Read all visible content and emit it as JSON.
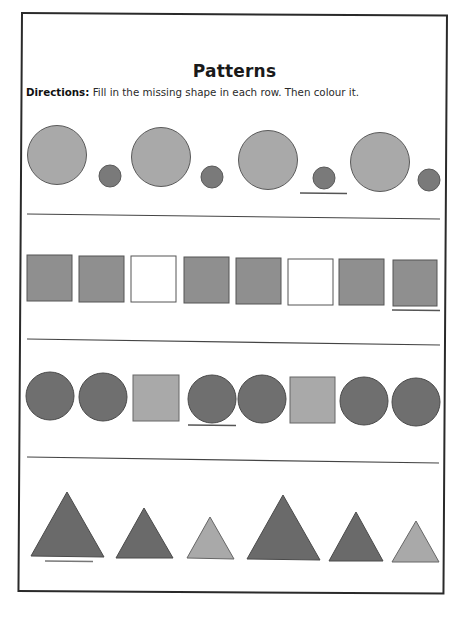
{
  "worksheet": {
    "title": "Patterns",
    "directions_label": "Directions:",
    "directions_text": " Fill in the missing shape in each row. Then colour it."
  },
  "colors": {
    "light_gray": "#a9a9a9",
    "mid_gray": "#8f8f8f",
    "dark_gray": "#6f6f6f",
    "outline": "#555555",
    "blank": "#ffffff",
    "rule": "#444444",
    "border": "#2a2a2a"
  },
  "rows": [
    {
      "name": "circles-size-pattern",
      "shapes": [
        {
          "type": "circle",
          "size": "large",
          "fill": "light_gray"
        },
        {
          "type": "circle",
          "size": "small",
          "fill": "dark_gray"
        },
        {
          "type": "circle",
          "size": "large",
          "fill": "light_gray"
        },
        {
          "type": "circle",
          "size": "small",
          "fill": "dark_gray"
        },
        {
          "type": "circle",
          "size": "large",
          "fill": "light_gray"
        },
        {
          "type": "circle",
          "size": "small",
          "fill": "dark_gray",
          "answer_blank": true
        },
        {
          "type": "circle",
          "size": "large",
          "fill": "light_gray"
        },
        {
          "type": "circle",
          "size": "small",
          "fill": "dark_gray"
        }
      ]
    },
    {
      "name": "squares-color-pattern",
      "shapes": [
        {
          "type": "square",
          "fill": "mid_gray"
        },
        {
          "type": "square",
          "fill": "mid_gray"
        },
        {
          "type": "square",
          "fill": "blank"
        },
        {
          "type": "square",
          "fill": "mid_gray"
        },
        {
          "type": "square",
          "fill": "mid_gray"
        },
        {
          "type": "square",
          "fill": "blank"
        },
        {
          "type": "square",
          "fill": "mid_gray"
        },
        {
          "type": "square",
          "fill": "mid_gray",
          "answer_blank": true
        }
      ]
    },
    {
      "name": "circle-square-pattern",
      "shapes": [
        {
          "type": "circle",
          "fill": "dark_gray"
        },
        {
          "type": "circle",
          "fill": "dark_gray"
        },
        {
          "type": "square",
          "fill": "light_gray"
        },
        {
          "type": "circle",
          "fill": "dark_gray",
          "answer_blank": true
        },
        {
          "type": "circle",
          "fill": "dark_gray"
        },
        {
          "type": "square",
          "fill": "light_gray"
        },
        {
          "type": "circle",
          "fill": "dark_gray"
        },
        {
          "type": "circle",
          "fill": "dark_gray"
        }
      ]
    },
    {
      "name": "triangles-size-pattern",
      "shapes": [
        {
          "type": "triangle",
          "size": "large",
          "fill": "dark_gray",
          "answer_blank": true
        },
        {
          "type": "triangle",
          "size": "medium",
          "fill": "dark_gray"
        },
        {
          "type": "triangle",
          "size": "small",
          "fill": "light_gray"
        },
        {
          "type": "triangle",
          "size": "large",
          "fill": "dark_gray"
        },
        {
          "type": "triangle",
          "size": "medium",
          "fill": "dark_gray"
        },
        {
          "type": "triangle",
          "size": "small",
          "fill": "light_gray"
        }
      ]
    }
  ]
}
